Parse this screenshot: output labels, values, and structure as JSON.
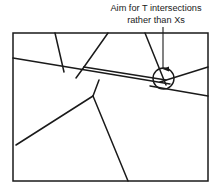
{
  "figure": {
    "type": "line-diagram",
    "width": 219,
    "height": 193,
    "background_color": "#ffffff",
    "stroke_color": "#1a1a1a"
  },
  "annotation": {
    "line1": "Aim for T intersections",
    "line2": "rather than Xs",
    "line1_x": 156,
    "line1_y": 11,
    "line2_x": 156,
    "line2_y": 23,
    "font_size": 9.2,
    "color": "#1a1a1a"
  },
  "arrow": {
    "name": "callout-arrow",
    "x1": 163,
    "y1": 27,
    "x2": 163,
    "y2": 69,
    "head_width": 5,
    "head_length": 7,
    "stroke_width": 1.1,
    "color": "#1a1a1a"
  },
  "highlight_circle": {
    "name": "x-intersection-highlight",
    "cx": 163.5,
    "cy": 78.5,
    "r": 10.5,
    "stroke_width": 1.4,
    "color": "#1a1a1a"
  },
  "border": {
    "name": "diagram-border",
    "x": 13,
    "y": 33,
    "width": 195,
    "height": 148,
    "stroke_width": 1.5,
    "color": "#1a1a1a"
  },
  "lines": [
    {
      "name": "long-diagonal-left-to-circle",
      "x1": 13,
      "y1": 58,
      "x2": 170,
      "y2": 84,
      "stroke_width": 1.5
    },
    {
      "name": "top-edge-drop-left",
      "x1": 55,
      "y1": 33,
      "x2": 64,
      "y2": 72,
      "stroke_width": 1.5
    },
    {
      "name": "top-edge-v-left-arm",
      "x1": 108,
      "y1": 33,
      "x2": 84,
      "y2": 67,
      "stroke_width": 1.5
    },
    {
      "name": "v-left-arm-lower",
      "x1": 84,
      "y1": 67,
      "x2": 76,
      "y2": 78,
      "stroke_width": 1.5
    },
    {
      "name": "mid-horizontal-ridge",
      "x1": 84,
      "y1": 67,
      "x2": 166,
      "y2": 80,
      "stroke_width": 1.5
    },
    {
      "name": "top-edge-drop-right",
      "x1": 145,
      "y1": 33,
      "x2": 166,
      "y2": 85,
      "stroke_width": 1.5
    },
    {
      "name": "circle-to-right-edge-upper",
      "x1": 160,
      "y1": 82,
      "x2": 208,
      "y2": 67,
      "stroke_width": 1.5
    },
    {
      "name": "circle-to-right-edge-lower",
      "x1": 150,
      "y1": 86,
      "x2": 208,
      "y2": 96,
      "stroke_width": 1.5
    },
    {
      "name": "t-hub-to-bottom-left",
      "x1": 93,
      "y1": 96,
      "x2": 16,
      "y2": 145,
      "stroke_width": 1.5
    },
    {
      "name": "t-hub-to-bottom-edge",
      "x1": 93,
      "y1": 96,
      "x2": 128,
      "y2": 181,
      "stroke_width": 1.5
    },
    {
      "name": "t-hub-stem-to-ridge",
      "x1": 93,
      "y1": 96,
      "x2": 99,
      "y2": 80,
      "stroke_width": 1.5
    }
  ]
}
